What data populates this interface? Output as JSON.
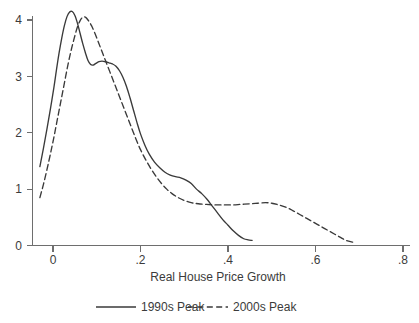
{
  "chart_data": {
    "type": "line",
    "title": "",
    "xlabel": "Real House Price Growth",
    "ylabel": "",
    "xlim": [
      -0.04,
      0.82
    ],
    "ylim": [
      0,
      4.35
    ],
    "xticks": [
      0,
      0.2,
      0.4,
      0.6,
      0.8
    ],
    "xticklabels": [
      "0",
      ".2",
      ".4",
      ".6",
      ".8"
    ],
    "yticks": [
      0,
      1,
      2,
      3,
      4
    ],
    "yticklabels": [
      "0",
      "1",
      "2",
      "3",
      "4"
    ],
    "grid": false,
    "legend_position": "bottom",
    "series": [
      {
        "name": "1990s Peak",
        "style": "solid",
        "color": "#3a3a3a",
        "points": [
          [
            -0.03,
            1.4
          ],
          [
            -0.022,
            1.72
          ],
          [
            -0.014,
            2.06
          ],
          [
            -0.006,
            2.42
          ],
          [
            0.002,
            2.8
          ],
          [
            0.008,
            3.12
          ],
          [
            0.014,
            3.42
          ],
          [
            0.02,
            3.68
          ],
          [
            0.026,
            3.9
          ],
          [
            0.032,
            4.06
          ],
          [
            0.038,
            4.14
          ],
          [
            0.044,
            4.15
          ],
          [
            0.05,
            4.08
          ],
          [
            0.056,
            3.94
          ],
          [
            0.062,
            3.76
          ],
          [
            0.068,
            3.58
          ],
          [
            0.074,
            3.42
          ],
          [
            0.08,
            3.28
          ],
          [
            0.086,
            3.21
          ],
          [
            0.092,
            3.2
          ],
          [
            0.098,
            3.23
          ],
          [
            0.105,
            3.26
          ],
          [
            0.112,
            3.27
          ],
          [
            0.12,
            3.26
          ],
          [
            0.128,
            3.24
          ],
          [
            0.136,
            3.22
          ],
          [
            0.144,
            3.18
          ],
          [
            0.152,
            3.1
          ],
          [
            0.16,
            2.98
          ],
          [
            0.168,
            2.82
          ],
          [
            0.176,
            2.62
          ],
          [
            0.184,
            2.4
          ],
          [
            0.192,
            2.18
          ],
          [
            0.2,
            1.98
          ],
          [
            0.21,
            1.78
          ],
          [
            0.22,
            1.62
          ],
          [
            0.232,
            1.48
          ],
          [
            0.244,
            1.38
          ],
          [
            0.256,
            1.3
          ],
          [
            0.268,
            1.25
          ],
          [
            0.28,
            1.22
          ],
          [
            0.292,
            1.2
          ],
          [
            0.304,
            1.16
          ],
          [
            0.316,
            1.1
          ],
          [
            0.328,
            1.0
          ],
          [
            0.34,
            0.92
          ],
          [
            0.352,
            0.82
          ],
          [
            0.364,
            0.7
          ],
          [
            0.376,
            0.58
          ],
          [
            0.388,
            0.46
          ],
          [
            0.4,
            0.36
          ],
          [
            0.412,
            0.26
          ],
          [
            0.424,
            0.18
          ],
          [
            0.436,
            0.12
          ],
          [
            0.446,
            0.1
          ],
          [
            0.455,
            0.09
          ]
        ]
      },
      {
        "name": "2000s Peak",
        "style": "dashed",
        "color": "#3a3a3a",
        "points": [
          [
            -0.03,
            0.85
          ],
          [
            -0.022,
            1.08
          ],
          [
            -0.014,
            1.34
          ],
          [
            -0.006,
            1.62
          ],
          [
            0.002,
            1.92
          ],
          [
            0.01,
            2.24
          ],
          [
            0.018,
            2.56
          ],
          [
            0.026,
            2.88
          ],
          [
            0.034,
            3.2
          ],
          [
            0.042,
            3.48
          ],
          [
            0.05,
            3.72
          ],
          [
            0.056,
            3.88
          ],
          [
            0.062,
            3.99
          ],
          [
            0.068,
            4.05
          ],
          [
            0.074,
            4.05
          ],
          [
            0.08,
            4.0
          ],
          [
            0.088,
            3.9
          ],
          [
            0.096,
            3.76
          ],
          [
            0.104,
            3.6
          ],
          [
            0.112,
            3.44
          ],
          [
            0.12,
            3.28
          ],
          [
            0.13,
            3.08
          ],
          [
            0.14,
            2.88
          ],
          [
            0.15,
            2.68
          ],
          [
            0.16,
            2.48
          ],
          [
            0.17,
            2.28
          ],
          [
            0.18,
            2.08
          ],
          [
            0.19,
            1.88
          ],
          [
            0.2,
            1.7
          ],
          [
            0.212,
            1.52
          ],
          [
            0.224,
            1.36
          ],
          [
            0.236,
            1.22
          ],
          [
            0.248,
            1.1
          ],
          [
            0.26,
            1.0
          ],
          [
            0.272,
            0.92
          ],
          [
            0.286,
            0.85
          ],
          [
            0.3,
            0.8
          ],
          [
            0.316,
            0.76
          ],
          [
            0.332,
            0.74
          ],
          [
            0.35,
            0.73
          ],
          [
            0.37,
            0.72
          ],
          [
            0.39,
            0.72
          ],
          [
            0.41,
            0.72
          ],
          [
            0.43,
            0.73
          ],
          [
            0.45,
            0.74
          ],
          [
            0.468,
            0.75
          ],
          [
            0.486,
            0.76
          ],
          [
            0.5,
            0.75
          ],
          [
            0.516,
            0.72
          ],
          [
            0.532,
            0.68
          ],
          [
            0.548,
            0.62
          ],
          [
            0.564,
            0.55
          ],
          [
            0.58,
            0.48
          ],
          [
            0.596,
            0.41
          ],
          [
            0.612,
            0.34
          ],
          [
            0.628,
            0.27
          ],
          [
            0.644,
            0.2
          ],
          [
            0.658,
            0.14
          ],
          [
            0.67,
            0.09
          ],
          [
            0.685,
            0.06
          ]
        ]
      }
    ],
    "legend": [
      {
        "label": "1990s Peak",
        "style": "solid"
      },
      {
        "label": "2000s Peak",
        "style": "dashed"
      }
    ]
  },
  "axis": {
    "x_title": "Real House Price Growth"
  },
  "colors": {
    "line": "#3a3a3a",
    "axis": "#6e6e6e",
    "text": "#3b3b3b",
    "background": "#ffffff"
  }
}
